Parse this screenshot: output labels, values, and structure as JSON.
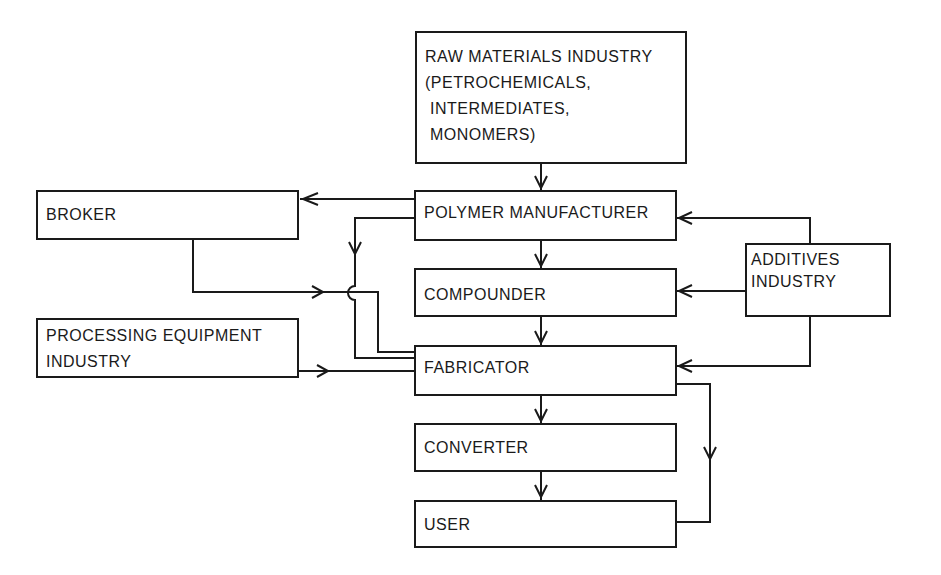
{
  "diagram": {
    "type": "flowchart",
    "nodes": [
      {
        "id": "raw",
        "label_lines": [
          "RAW MATERIALS INDUSTRY",
          "(PETROCHEMICALS,",
          " INTERMEDIATES,",
          " MONOMERS)"
        ]
      },
      {
        "id": "polymer",
        "label": "POLYMER MANUFACTURER"
      },
      {
        "id": "compounder",
        "label": "COMPOUNDER"
      },
      {
        "id": "fabricator",
        "label": "FABRICATOR"
      },
      {
        "id": "converter",
        "label": "CONVERTER"
      },
      {
        "id": "user",
        "label": "USER"
      },
      {
        "id": "broker",
        "label": "BROKER"
      },
      {
        "id": "processing",
        "label_lines": [
          "PROCESSING EQUIPMENT",
          "INDUSTRY"
        ]
      },
      {
        "id": "additives",
        "label_lines": [
          "ADDITIVES",
          "INDUSTRY"
        ]
      }
    ],
    "edges": [
      {
        "from": "raw",
        "to": "polymer"
      },
      {
        "from": "polymer",
        "to": "broker"
      },
      {
        "from": "polymer",
        "to": "fabricator"
      },
      {
        "from": "polymer",
        "to": "compounder"
      },
      {
        "from": "broker",
        "to": "fabricator"
      },
      {
        "from": "compounder",
        "to": "fabricator"
      },
      {
        "from": "processing",
        "to": "fabricator"
      },
      {
        "from": "additives",
        "to": "polymer"
      },
      {
        "from": "additives",
        "to": "compounder"
      },
      {
        "from": "additives",
        "to": "fabricator"
      },
      {
        "from": "fabricator",
        "to": "converter"
      },
      {
        "from": "fabricator",
        "to": "user"
      },
      {
        "from": "converter",
        "to": "user"
      }
    ],
    "line_color": "#1a1a1a"
  }
}
